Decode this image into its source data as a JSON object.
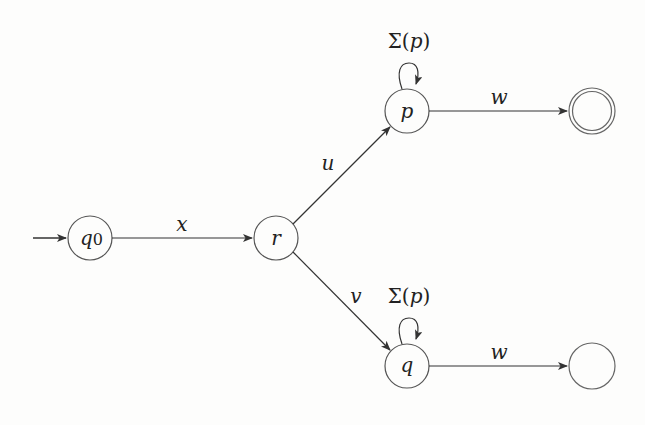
{
  "diagram": {
    "type": "finite-automaton",
    "states": [
      {
        "id": "q0",
        "label": "q",
        "sub": "0",
        "initial": true,
        "accepting": false
      },
      {
        "id": "r",
        "label": "r",
        "initial": false,
        "accepting": false
      },
      {
        "id": "p",
        "label": "p",
        "initial": false,
        "accepting": false
      },
      {
        "id": "q",
        "label": "q",
        "initial": false,
        "accepting": false
      },
      {
        "id": "f1",
        "label": "",
        "initial": false,
        "accepting": true
      },
      {
        "id": "f2",
        "label": "",
        "initial": false,
        "accepting": false
      }
    ],
    "edges": [
      {
        "from": "q0",
        "to": "r",
        "label": "x"
      },
      {
        "from": "r",
        "to": "p",
        "label": "u"
      },
      {
        "from": "r",
        "to": "q",
        "label": "v"
      },
      {
        "from": "p",
        "to": "p",
        "label_pre": "Σ(",
        "label_var": "p",
        "label_post": ")"
      },
      {
        "from": "q",
        "to": "q",
        "label_pre": "Σ(",
        "label_var": "p",
        "label_post": ")"
      },
      {
        "from": "p",
        "to": "f1",
        "label": "w"
      },
      {
        "from": "q",
        "to": "f2",
        "label": "w"
      }
    ]
  }
}
